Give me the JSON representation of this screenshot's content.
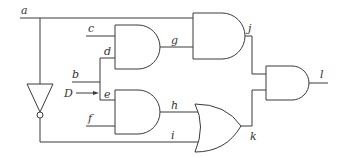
{
  "diagram": {
    "type": "logic-circuit",
    "signals": {
      "a": "a",
      "b": "b",
      "c": "c",
      "d": "d",
      "D": "D",
      "e": "e",
      "f": "f",
      "g": "g",
      "h": "h",
      "i": "i",
      "j": "j",
      "k": "k",
      "l": "l"
    },
    "gates": [
      {
        "id": "and1",
        "kind": "AND",
        "inputs": [
          "c",
          "d"
        ],
        "output": "g"
      },
      {
        "id": "and2",
        "kind": "AND",
        "inputs": [
          "a",
          "g"
        ],
        "output": "j"
      },
      {
        "id": "and3",
        "kind": "AND",
        "inputs": [
          "e",
          "f"
        ],
        "output": "h"
      },
      {
        "id": "not1",
        "kind": "NOT",
        "inputs": [
          "a"
        ],
        "output": "i"
      },
      {
        "id": "or1",
        "kind": "OR",
        "inputs": [
          "h",
          "i"
        ],
        "output": "k"
      },
      {
        "id": "and4",
        "kind": "AND",
        "inputs": [
          "j",
          "k"
        ],
        "output": "l"
      }
    ],
    "annotations": {
      "fault_marker": "D",
      "fault_arrow": "arrow-right"
    },
    "colors": {
      "line": "#3a3a3a",
      "label": "#333333",
      "background": "#ffffff"
    }
  }
}
